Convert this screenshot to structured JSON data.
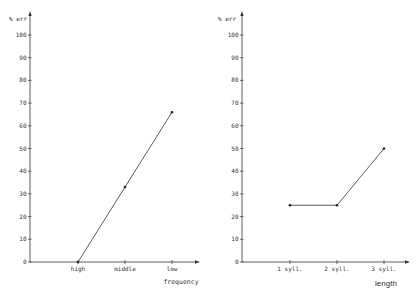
{
  "chart_data": [
    {
      "type": "line",
      "title": "",
      "ylabel": "% err",
      "xlabel": "frequency",
      "categories": [
        "high",
        "middle",
        "low"
      ],
      "values": [
        0,
        33,
        66
      ],
      "ylim": [
        0,
        100
      ],
      "yticks": [
        0,
        10,
        20,
        30,
        40,
        50,
        60,
        70,
        80,
        90,
        100
      ],
      "grid": false,
      "legend": null
    },
    {
      "type": "line",
      "title": "",
      "ylabel": "% err",
      "xlabel": "length",
      "categories": [
        "1 syll.",
        "2 syll.",
        "3 syll."
      ],
      "values": [
        25,
        25,
        50
      ],
      "ylim": [
        0,
        100
      ],
      "yticks": [
        0,
        10,
        20,
        30,
        40,
        50,
        60,
        70,
        80,
        90,
        100
      ],
      "grid": false,
      "legend": null
    }
  ],
  "charts": {
    "left": {
      "ylabel": "% err",
      "xlabel": "frequency",
      "yticks": [
        "0",
        "10",
        "20",
        "30",
        "40",
        "50",
        "60",
        "70",
        "80",
        "90",
        "100"
      ],
      "categories": [
        "high",
        "middle",
        "low"
      ]
    },
    "right": {
      "ylabel": "% err",
      "xlabel": "length",
      "yticks": [
        "0",
        "10",
        "20",
        "30",
        "40",
        "50",
        "60",
        "70",
        "80",
        "90",
        "100"
      ],
      "categories": [
        "1 syll.",
        "2 syll.",
        "3 syll."
      ]
    }
  }
}
